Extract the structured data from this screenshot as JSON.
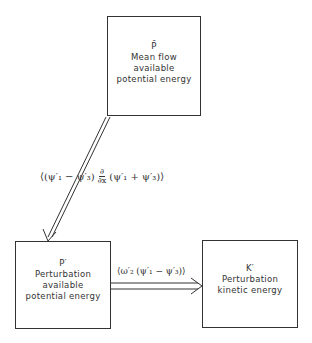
{
  "diagram": {
    "boxes": {
      "mean_flow": {
        "symbol": "P̄",
        "line1": "Mean flow",
        "line2": "available",
        "line3": "potential energy"
      },
      "perturbation_ape": {
        "symbol": "P′",
        "line1": "Perturbation",
        "line2": "available",
        "line3": "potential energy"
      },
      "perturbation_ke": {
        "symbol": "K′",
        "line1": "Perturbation",
        "line2": "kinetic energy"
      }
    },
    "arrows": {
      "mean_to_perturbation": {
        "label_left": "⟨(ψ′₁ − ψ′₃)",
        "frac_num": "∂",
        "frac_den": "∂x",
        "label_right": "(ψ′₁ + ψ′₃)⟩"
      },
      "ape_to_ke": {
        "label": "⟨ω′₂ (ψ′₁ − ψ′₃)⟩"
      }
    },
    "colors": {
      "line": "#333333",
      "background": "#ffffff"
    }
  }
}
